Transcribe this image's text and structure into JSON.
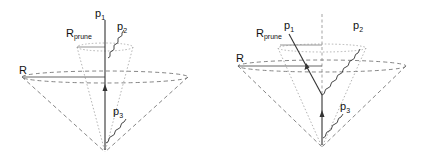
{
  "figure": {
    "left_panel": {
      "labels": {
        "p1": "p",
        "p1_sub": "1",
        "p2": "p",
        "p2_sub": "2",
        "p3": "p",
        "p3_sub": "3",
        "R": "R",
        "Rprune": "R",
        "Rprune_sub": "prune"
      }
    },
    "right_panel": {
      "labels": {
        "p1": "p",
        "p1_sub": "1",
        "p2": "p",
        "p2_sub": "2",
        "p3": "p",
        "p3_sub": "3",
        "R": "R",
        "Rprune": "R",
        "Rprune_sub": "prune"
      }
    },
    "colors": {
      "line": "#333333",
      "dashed": "#777777",
      "dotted": "#aaaaaa"
    }
  }
}
